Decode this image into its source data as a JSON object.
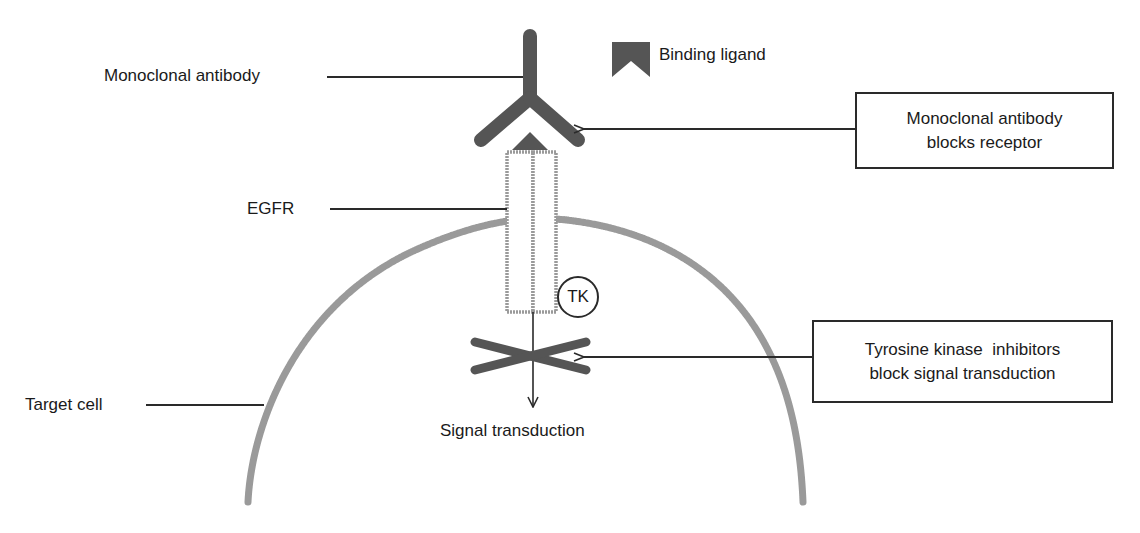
{
  "diagram": {
    "labels": {
      "monoclonal_antibody": "Monoclonal antibody",
      "binding_ligand": "Binding ligand",
      "egfr": "EGFR",
      "target_cell": "Target cell",
      "signal_transduction": "Signal transduction",
      "tk": "TK"
    },
    "callouts": {
      "antibody_blocks": {
        "line1": "Monoclonal antibody",
        "line2": "blocks receptor"
      },
      "tki_blocks": {
        "line1": "Tyrosine kinase  inhibitors",
        "line2": "block signal transduction"
      }
    },
    "legend": {
      "icon": "binding-ligand-chevron-icon",
      "label": "Binding ligand"
    },
    "colors": {
      "antibody": "#555555",
      "membrane": "#9a9a9a",
      "line": "#2a2a2a",
      "text": "#1a1a1a",
      "background": "#ffffff"
    }
  }
}
